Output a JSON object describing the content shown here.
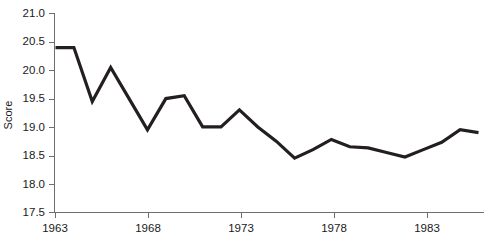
{
  "chart_data": {
    "type": "line",
    "title": "",
    "subtitle": "",
    "xlabel": "",
    "ylabel": "Score",
    "xlim": [
      1963,
      1986
    ],
    "ylim": [
      17.5,
      21.0
    ],
    "grid": false,
    "legend": false,
    "legend_position": "none",
    "line_color": "#231f20",
    "axis_color": "#6e6e6e",
    "x_ticks": [
      1963,
      1968,
      1973,
      1978,
      1983
    ],
    "x_tick_labels": [
      "1963",
      "1968",
      "1973",
      "1978",
      "1983"
    ],
    "y_ticks": [
      17.5,
      18.0,
      18.5,
      19.0,
      19.5,
      20.0,
      20.5,
      21.0
    ],
    "y_tick_labels": [
      "17.5",
      "18.0",
      "18.5",
      "19.0",
      "19.5",
      "20.0",
      "20.5",
      "21.0"
    ],
    "x": [
      1963,
      1964,
      1965,
      1966,
      1967,
      1968,
      1969,
      1970,
      1971,
      1972,
      1973,
      1974,
      1975,
      1976,
      1977,
      1978,
      1979,
      1980,
      1981,
      1982,
      1983,
      1984,
      1985,
      1986
    ],
    "series": [
      {
        "name": "Score",
        "values": [
          20.4,
          20.4,
          19.45,
          20.05,
          19.5,
          18.95,
          19.5,
          19.55,
          19.0,
          19.0,
          19.3,
          19.0,
          18.75,
          18.45,
          18.6,
          18.78,
          18.65,
          18.63,
          18.55,
          18.47,
          18.6,
          18.73,
          18.95,
          18.9
        ]
      }
    ],
    "annotations": []
  },
  "axes": {
    "y_axis_title": "Score"
  }
}
